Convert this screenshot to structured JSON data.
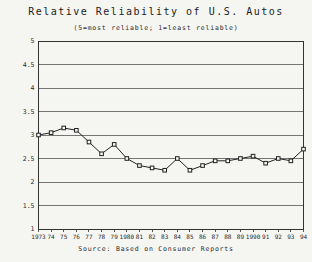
{
  "chart_data": {
    "type": "line",
    "title": "Relative Reliability of U.S. Autos",
    "subtitle": "(5=most reliable; 1=least reliable)",
    "source": "Source: Based on Consumer Reports",
    "categories": [
      "1973",
      "74",
      "75",
      "76",
      "77",
      "78",
      "79",
      "1980",
      "81",
      "82",
      "83",
      "84",
      "85",
      "86",
      "87",
      "88",
      "89",
      "1990",
      "91",
      "92",
      "93",
      "94"
    ],
    "values": [
      3.0,
      3.05,
      3.15,
      3.1,
      2.85,
      2.6,
      2.8,
      2.5,
      2.35,
      2.3,
      2.25,
      2.5,
      2.25,
      2.35,
      2.45,
      2.45,
      2.5,
      2.55,
      2.4,
      2.5,
      2.45,
      2.7
    ],
    "xlabel": "",
    "ylabel": "",
    "ylim": [
      1,
      5
    ],
    "ytick_step": 0.5,
    "y_tick_labels": [
      "5",
      "4.5",
      "4",
      "3.5",
      "3",
      "2.5",
      "2",
      "1.5",
      "1"
    ],
    "grid": "horizontal",
    "legend": "none",
    "marker": "open-square",
    "line_color": "#222222",
    "grid_color": "#555555",
    "axis_color": "#333333",
    "background_color": "#f5f5f2"
  }
}
